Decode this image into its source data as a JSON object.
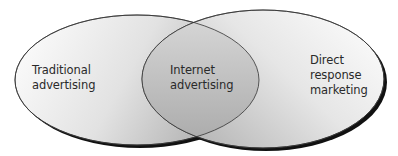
{
  "diagram": {
    "type": "venn",
    "sets": [
      {
        "id": "left",
        "label_lines": [
          "Traditional",
          "advertising"
        ]
      },
      {
        "id": "right",
        "label_lines": [
          "Direct",
          "response",
          "marketing"
        ]
      }
    ],
    "intersection": {
      "label_lines": [
        "Internet",
        "advertising"
      ]
    },
    "colors": {
      "fill_light": "#ffffff",
      "fill_dark": "#b8b8b8",
      "outline": "#333333",
      "shadow": "#111111"
    }
  }
}
